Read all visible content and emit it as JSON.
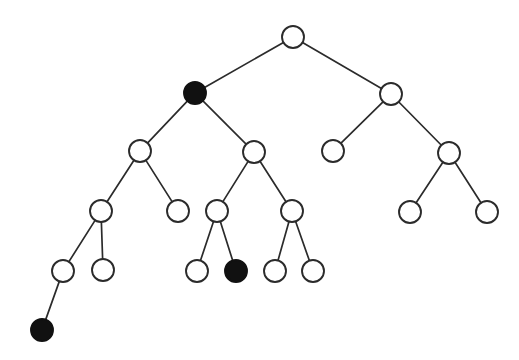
{
  "figure": {
    "kind": "tree-diagram",
    "width": 519,
    "height": 360,
    "background_color": "#ffffff",
    "edge_color": "#2b2b2b",
    "node_outline_color": "#2b2b2b",
    "node_open_fill": "#ffffff",
    "node_filled_fill": "#111111",
    "node_radius": 11,
    "edge_width": 1.7,
    "node_stroke_width": 1.9,
    "filled_node_count": 3,
    "open_node_count": 17,
    "total_node_count": 20,
    "depth_levels": 6
  },
  "nodes": [
    {
      "id": "n0",
      "label": "root",
      "x": 293,
      "y": 37,
      "r": 11,
      "filled": false,
      "level": 0
    },
    {
      "id": "n1",
      "label": "left-child",
      "x": 195,
      "y": 93,
      "r": 11,
      "filled": true,
      "level": 1
    },
    {
      "id": "n2",
      "label": "right-child",
      "x": 391,
      "y": 94,
      "r": 11,
      "filled": false,
      "level": 1
    },
    {
      "id": "n3",
      "label": "l-l",
      "x": 140,
      "y": 151,
      "r": 11,
      "filled": false,
      "level": 2
    },
    {
      "id": "n4",
      "label": "l-r",
      "x": 254,
      "y": 152,
      "r": 11,
      "filled": false,
      "level": 2
    },
    {
      "id": "n5",
      "label": "r-l",
      "x": 333,
      "y": 151,
      "r": 11,
      "filled": false,
      "level": 2
    },
    {
      "id": "n6",
      "label": "r-r",
      "x": 449,
      "y": 153,
      "r": 11,
      "filled": false,
      "level": 2
    },
    {
      "id": "n7",
      "label": "l-l-l",
      "x": 101,
      "y": 211,
      "r": 11,
      "filled": false,
      "level": 3
    },
    {
      "id": "n8",
      "label": "l-l-r",
      "x": 178,
      "y": 211,
      "r": 11,
      "filled": false,
      "level": 3
    },
    {
      "id": "n9",
      "label": "l-r-l",
      "x": 217,
      "y": 211,
      "r": 11,
      "filled": false,
      "level": 3
    },
    {
      "id": "n10",
      "label": "l-r-r",
      "x": 292,
      "y": 211,
      "r": 11,
      "filled": false,
      "level": 3
    },
    {
      "id": "n11",
      "label": "r-r-l",
      "x": 410,
      "y": 212,
      "r": 11,
      "filled": false,
      "level": 3
    },
    {
      "id": "n12",
      "label": "r-r-r",
      "x": 487,
      "y": 212,
      "r": 11,
      "filled": false,
      "level": 3
    },
    {
      "id": "n13",
      "label": "l-l-l-l",
      "x": 63,
      "y": 271,
      "r": 11,
      "filled": false,
      "level": 4
    },
    {
      "id": "n14",
      "label": "l-l-l-r",
      "x": 103,
      "y": 270,
      "r": 11,
      "filled": false,
      "level": 4
    },
    {
      "id": "n15",
      "label": "l-r-l-l",
      "x": 197,
      "y": 271,
      "r": 11,
      "filled": false,
      "level": 4
    },
    {
      "id": "n16",
      "label": "l-r-l-r",
      "x": 236,
      "y": 271,
      "r": 11,
      "filled": true,
      "level": 4
    },
    {
      "id": "n17",
      "label": "l-r-r-l",
      "x": 275,
      "y": 271,
      "r": 11,
      "filled": false,
      "level": 4
    },
    {
      "id": "n18",
      "label": "l-r-r-r",
      "x": 313,
      "y": 271,
      "r": 11,
      "filled": false,
      "level": 4
    },
    {
      "id": "n19",
      "label": "l-l-l-l-l",
      "x": 42,
      "y": 330,
      "r": 11,
      "filled": true,
      "level": 5
    }
  ],
  "edges": [
    {
      "id": "e0",
      "from": "n0",
      "to": "n1"
    },
    {
      "id": "e1",
      "from": "n0",
      "to": "n2"
    },
    {
      "id": "e2",
      "from": "n1",
      "to": "n3"
    },
    {
      "id": "e3",
      "from": "n1",
      "to": "n4"
    },
    {
      "id": "e4",
      "from": "n2",
      "to": "n5"
    },
    {
      "id": "e5",
      "from": "n2",
      "to": "n6"
    },
    {
      "id": "e6",
      "from": "n3",
      "to": "n7"
    },
    {
      "id": "e7",
      "from": "n3",
      "to": "n8"
    },
    {
      "id": "e8",
      "from": "n4",
      "to": "n9"
    },
    {
      "id": "e9",
      "from": "n4",
      "to": "n10"
    },
    {
      "id": "e10",
      "from": "n6",
      "to": "n11"
    },
    {
      "id": "e11",
      "from": "n6",
      "to": "n12"
    },
    {
      "id": "e12",
      "from": "n7",
      "to": "n13"
    },
    {
      "id": "e13",
      "from": "n7",
      "to": "n14"
    },
    {
      "id": "e14",
      "from": "n9",
      "to": "n15"
    },
    {
      "id": "e15",
      "from": "n9",
      "to": "n16"
    },
    {
      "id": "e16",
      "from": "n10",
      "to": "n17"
    },
    {
      "id": "e17",
      "from": "n10",
      "to": "n18"
    },
    {
      "id": "e18",
      "from": "n13",
      "to": "n19"
    }
  ]
}
